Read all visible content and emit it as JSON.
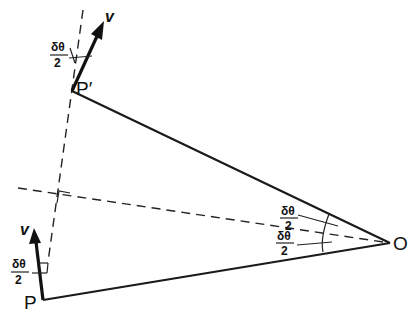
{
  "diagram": {
    "type": "geometry-vector",
    "points": {
      "P": "P",
      "P_prime": "P′",
      "O": "O"
    },
    "vectors": {
      "v_top": "v",
      "v_bottom": "v"
    },
    "angles": {
      "top_numer": "δθ",
      "top_denom": "2",
      "bottom_numer": "δθ",
      "bottom_denom": "2",
      "center_upper_numer": "δθ",
      "center_upper_denom": "2",
      "center_lower_numer": "δθ",
      "center_lower_denom": "2"
    },
    "colors": {
      "ink": "#111111",
      "background": "#ffffff"
    }
  }
}
